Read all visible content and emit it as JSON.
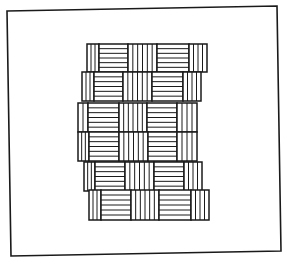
{
  "figure": {
    "stroke_color": "#1a1a1a",
    "background_color": "#ffffff",
    "frame": {
      "points": [
        [
          7,
          11
        ],
        [
          277,
          6
        ],
        [
          281,
          251
        ],
        [
          11,
          256
        ]
      ]
    },
    "rows": [
      {
        "y0": 44,
        "y1": 72,
        "blocks": [
          {
            "x0": 87,
            "x1": 99,
            "stripes": "vertical",
            "lines": 2
          },
          {
            "x0": 99,
            "x1": 128,
            "stripes": "horizontal",
            "lines": 5
          },
          {
            "x0": 128,
            "x1": 157,
            "stripes": "vertical",
            "lines": 5
          },
          {
            "x0": 157,
            "x1": 189,
            "stripes": "horizontal",
            "lines": 5
          },
          {
            "x0": 189,
            "x1": 207,
            "stripes": "vertical",
            "lines": 3
          }
        ]
      },
      {
        "y0": 72,
        "y1": 101,
        "blocks": [
          {
            "x0": 82,
            "x1": 94,
            "stripes": "vertical",
            "lines": 2
          },
          {
            "x0": 94,
            "x1": 123,
            "stripes": "horizontal",
            "lines": 5
          },
          {
            "x0": 123,
            "x1": 152,
            "stripes": "vertical",
            "lines": 5
          },
          {
            "x0": 152,
            "x1": 183,
            "stripes": "horizontal",
            "lines": 5
          },
          {
            "x0": 183,
            "x1": 201,
            "stripes": "vertical",
            "lines": 3
          }
        ]
      },
      {
        "y0": 103,
        "y1": 132,
        "blocks": [
          {
            "x0": 78,
            "x1": 88,
            "stripes": "vertical",
            "lines": 1
          },
          {
            "x0": 88,
            "x1": 119,
            "stripes": "horizontal",
            "lines": 5
          },
          {
            "x0": 119,
            "x1": 147,
            "stripes": "vertical",
            "lines": 5
          },
          {
            "x0": 147,
            "x1": 177,
            "stripes": "horizontal",
            "lines": 5
          },
          {
            "x0": 177,
            "x1": 197,
            "stripes": "vertical",
            "lines": 3
          }
        ]
      },
      {
        "y0": 132,
        "y1": 161,
        "blocks": [
          {
            "x0": 78,
            "x1": 89,
            "stripes": "vertical",
            "lines": 2
          },
          {
            "x0": 89,
            "x1": 119,
            "stripes": "horizontal",
            "lines": 5
          },
          {
            "x0": 119,
            "x1": 148,
            "stripes": "vertical",
            "lines": 5
          },
          {
            "x0": 148,
            "x1": 177,
            "stripes": "horizontal",
            "lines": 5
          },
          {
            "x0": 177,
            "x1": 197,
            "stripes": "vertical",
            "lines": 3
          }
        ]
      },
      {
        "y0": 162,
        "y1": 191,
        "blocks": [
          {
            "x0": 84,
            "x1": 95,
            "stripes": "vertical",
            "lines": 2
          },
          {
            "x0": 95,
            "x1": 125,
            "stripes": "horizontal",
            "lines": 5
          },
          {
            "x0": 125,
            "x1": 154,
            "stripes": "vertical",
            "lines": 5
          },
          {
            "x0": 154,
            "x1": 184,
            "stripes": "horizontal",
            "lines": 5
          },
          {
            "x0": 184,
            "x1": 202,
            "stripes": "vertical",
            "lines": 3
          }
        ]
      },
      {
        "y0": 190,
        "y1": 220,
        "blocks": [
          {
            "x0": 89,
            "x1": 101,
            "stripes": "vertical",
            "lines": 2
          },
          {
            "x0": 101,
            "x1": 131,
            "stripes": "horizontal",
            "lines": 5
          },
          {
            "x0": 131,
            "x1": 159,
            "stripes": "vertical",
            "lines": 5
          },
          {
            "x0": 159,
            "x1": 191,
            "stripes": "horizontal",
            "lines": 5
          },
          {
            "x0": 191,
            "x1": 209,
            "stripes": "vertical",
            "lines": 3
          }
        ]
      }
    ]
  }
}
